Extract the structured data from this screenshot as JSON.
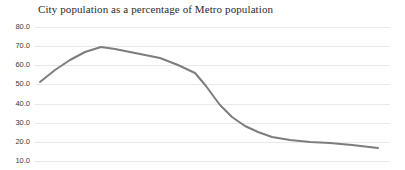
{
  "chart_data": {
    "type": "line",
    "title": "City population as a percentage of Metro population",
    "xlabel": "",
    "ylabel": "",
    "ylim": [
      10.0,
      80.0
    ],
    "yticks": [
      80.0,
      70.0,
      60.0,
      50.0,
      40.0,
      30.0,
      20.0,
      10.0
    ],
    "ytick_labels": [
      "80.0",
      "70.0",
      "60.0",
      "50.0",
      "40.0",
      "30.0",
      "20.0",
      "10.0"
    ],
    "xticks": [],
    "xtick_labels": [],
    "grid": true,
    "legend": false,
    "legend_position": "none",
    "series": [
      {
        "name": "City population as a percentage of Metro population",
        "color": "#7d7d7d",
        "x": [
          0,
          1,
          2,
          3,
          4,
          5,
          6,
          7,
          8,
          9,
          10,
          11,
          12,
          13,
          14,
          15,
          16,
          17
        ],
        "values": [
          52.0,
          58.5,
          64.0,
          67.5,
          69.7,
          68.5,
          67.0,
          65.5,
          64.0,
          61.0,
          57.2,
          50.0,
          44.0,
          41.0,
          35.0,
          30.0,
          27.0,
          25.0
        ]
      }
    ]
  },
  "series_points_px": [
    [
      40,
      82
    ],
    [
      55,
      70
    ],
    [
      70,
      60
    ],
    [
      85,
      52
    ],
    [
      101,
      47
    ],
    [
      115,
      49
    ],
    [
      130,
      52
    ],
    [
      145,
      55
    ],
    [
      160,
      58
    ],
    [
      178,
      65
    ],
    [
      195,
      73
    ],
    [
      206,
      86
    ],
    [
      214,
      97
    ],
    [
      220,
      105
    ],
    [
      232,
      117
    ],
    [
      245,
      126
    ],
    [
      258,
      132
    ],
    [
      272,
      137
    ],
    [
      290,
      140
    ],
    [
      310,
      142
    ],
    [
      330,
      143
    ],
    [
      352,
      145
    ],
    [
      378,
      148
    ]
  ],
  "axis_geometry_px": {
    "plot_left": 35,
    "plot_right": 390,
    "y_top_value": 80.0,
    "y_top_px": 27,
    "y_bottom_value": 10.0,
    "y_bottom_px": 161
  },
  "style": {
    "line_color": "#7d7d7d",
    "gridline_color": "#e9e9e9",
    "title_color": "#2b2b2b",
    "tick_label_color": "#3a3a3a",
    "background": "#ffffff"
  }
}
